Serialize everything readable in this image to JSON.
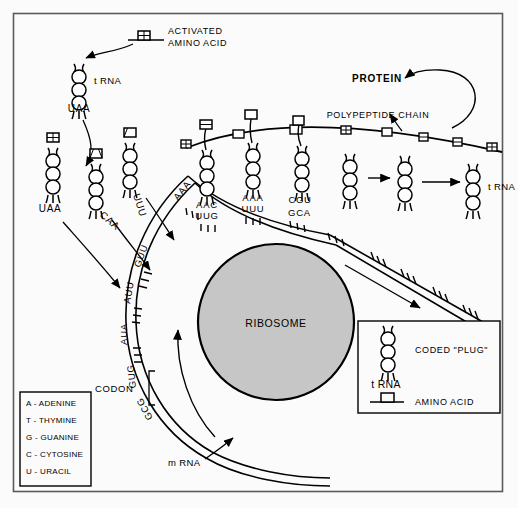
{
  "figure": {
    "frame_color": "#555555",
    "background": "#fbfbfb",
    "ribosome_fill": "#c6c6c6",
    "stroke_color": "#000000"
  },
  "labels": {
    "activated_amino_acid_line1": "ACTIVATED",
    "activated_amino_acid_line2": "AMINO  ACID",
    "trna_top": "t RNA",
    "trna_right": "t RNA",
    "protein": "PROTEIN",
    "polypeptide_chain": "POLYPEPTIDE   CHAIN",
    "ribosome": "RIBOSOME",
    "codon": "CODON",
    "mrna": "m RNA"
  },
  "trna_anticodons": [
    {
      "id": "trna-top-uaa",
      "text": "UAA"
    },
    {
      "id": "trna-free-uaa",
      "text": "UAA"
    },
    {
      "id": "trna-caa",
      "text": "CAA"
    },
    {
      "id": "trna-uuu",
      "text": "UUU"
    },
    {
      "id": "trna-aac",
      "text": "AAC"
    },
    {
      "id": "trna-aaa",
      "text": "AAA"
    },
    {
      "id": "trna-cgu",
      "text": "CGU"
    }
  ],
  "mrna_codons": [
    {
      "id": "codon-aaa",
      "text": "AAA"
    },
    {
      "id": "codon-uug",
      "text": "UUG"
    },
    {
      "id": "codon-uuu",
      "text": "UUU"
    },
    {
      "id": "codon-gca",
      "text": "GCA"
    },
    {
      "id": "codon-guu",
      "text": "GUU"
    },
    {
      "id": "codon-auu",
      "text": "AUU"
    },
    {
      "id": "codon-aua",
      "text": "AUA"
    },
    {
      "id": "codon-gug",
      "text": "GUG"
    },
    {
      "id": "codon-gcg",
      "text": "GCG"
    }
  ],
  "key_box": {
    "coded_plug_label": "CODED  \"PLUG\"",
    "trna_label": "t RNA",
    "amino_acid_label": "AMINO  ACID"
  },
  "nucleotide_legend": {
    "items": [
      "A - ADENINE",
      "T - THYMINE",
      "G - GUANINE",
      "C - CYTOSINE",
      "U - URACIL"
    ]
  }
}
